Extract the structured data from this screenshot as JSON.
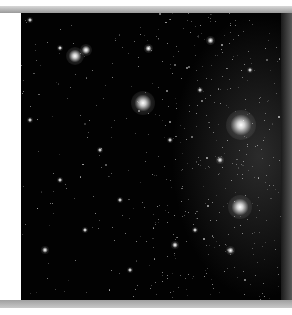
{
  "image": {
    "subject": "star field",
    "description": "Dense astronomical star field on black background with several bright stars and a diffuse nebular glow",
    "colors": {
      "background": "#020202",
      "stars": "#ffffff",
      "border": "#a8a8a8"
    }
  },
  "stars": [
    {
      "x": 143,
      "y": 103,
      "r": 4
    },
    {
      "x": 241,
      "y": 125,
      "r": 5
    },
    {
      "x": 240,
      "y": 207,
      "r": 4
    },
    {
      "x": 75,
      "y": 56,
      "r": 3
    },
    {
      "x": 86,
      "y": 50,
      "r": 2
    },
    {
      "x": 148,
      "y": 48,
      "r": 1.5
    },
    {
      "x": 60,
      "y": 48,
      "r": 1
    },
    {
      "x": 30,
      "y": 20,
      "r": 1
    },
    {
      "x": 210,
      "y": 40,
      "r": 1.5
    },
    {
      "x": 200,
      "y": 90,
      "r": 1
    },
    {
      "x": 120,
      "y": 200,
      "r": 1
    },
    {
      "x": 175,
      "y": 245,
      "r": 1.2
    },
    {
      "x": 45,
      "y": 250,
      "r": 1.2
    },
    {
      "x": 195,
      "y": 230,
      "r": 1
    },
    {
      "x": 230,
      "y": 250,
      "r": 1.5
    },
    {
      "x": 100,
      "y": 150,
      "r": 1
    },
    {
      "x": 60,
      "y": 180,
      "r": 1
    },
    {
      "x": 220,
      "y": 160,
      "r": 1.2
    },
    {
      "x": 170,
      "y": 140,
      "r": 1
    },
    {
      "x": 30,
      "y": 120,
      "r": 1
    },
    {
      "x": 130,
      "y": 270,
      "r": 1
    },
    {
      "x": 85,
      "y": 230,
      "r": 1
    },
    {
      "x": 250,
      "y": 70,
      "r": 1
    }
  ]
}
